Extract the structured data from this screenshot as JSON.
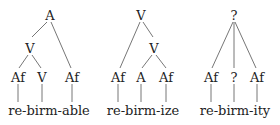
{
  "trees": [
    {
      "root": "A",
      "mid": "V",
      "leaves": [
        "Af",
        "V",
        "Af"
      ],
      "word": "re-birm-able"
    },
    {
      "root": "V",
      "mid": "V",
      "leaves": [
        "Af",
        "A",
        "Af"
      ],
      "word": "re-birm-ize"
    },
    {
      "root": "?",
      "leaves": [
        "Af",
        "?",
        "Af"
      ],
      "word": "re-birm-ity"
    }
  ],
  "colors": {
    "line": "#555555",
    "text": "#222222"
  }
}
